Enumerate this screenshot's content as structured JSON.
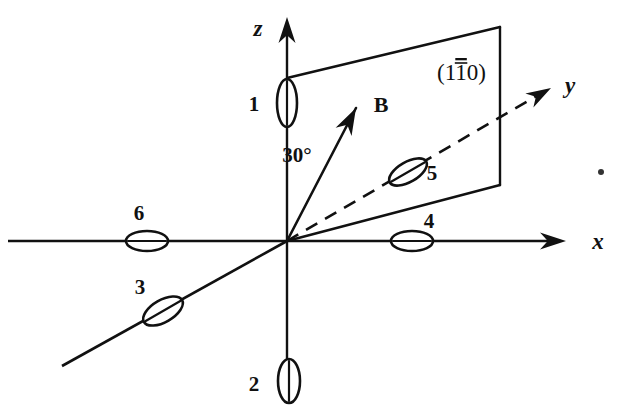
{
  "figure": {
    "background_color": "#ffffff",
    "ink_color": "#111111",
    "width": 631,
    "height": 419
  },
  "axes": {
    "x": {
      "label": "x",
      "label_x": 598,
      "label_y": 249,
      "line": {
        "x1": 8,
        "y1": 241,
        "x2": 556,
        "y2": 241
      },
      "arrow_at": {
        "x": 566,
        "y": 241
      },
      "style": "solid"
    },
    "y": {
      "label": "y",
      "label_x": 570,
      "label_y": 93,
      "line": {
        "x1": 287,
        "y1": 241,
        "x2": 540,
        "y2": 94
      },
      "arrow_at": {
        "x": 551,
        "y": 88
      },
      "style": "dashed",
      "negative_extension": {
        "x1": 287,
        "y1": 241,
        "x2": 62,
        "y2": 366,
        "style": "solid"
      }
    },
    "z": {
      "label": "z",
      "label_x": 258,
      "label_y": 36,
      "line": {
        "x1": 287,
        "y1": 398,
        "x2": 287,
        "y2": 29
      },
      "arrow_at": {
        "x": 287,
        "y": 17
      },
      "style": "solid"
    }
  },
  "origin": {
    "x": 287,
    "y": 241
  },
  "field_vector": {
    "symbol": "B",
    "label_x": 381,
    "label_y": 112,
    "angle_from_z_deg": "30°",
    "angle_label_x": 297,
    "angle_label_y": 162,
    "tail": {
      "x": 287,
      "y": 241
    },
    "tip": {
      "x": 356,
      "y": 108
    }
  },
  "plane": {
    "label": "(110)",
    "label_parts": {
      "pre": "(1",
      "barred": "1",
      "post": "0)"
    },
    "label_x": 437,
    "label_y": 80,
    "vertices": [
      {
        "x": 287,
        "y": 78
      },
      {
        "x": 500,
        "y": 27
      },
      {
        "x": 500,
        "y": 185
      },
      {
        "x": 287,
        "y": 241
      }
    ],
    "drawn_edges": [
      "top",
      "right",
      "bottom-slant"
    ]
  },
  "domains": [
    {
      "id": "1",
      "label": "1",
      "label_x": 254,
      "label_y": 111,
      "center_x": 287,
      "center_y": 103,
      "rx": 10,
      "ry": 24,
      "rotation_deg": 0,
      "orientation": "vertical",
      "on_axis": "z-positive"
    },
    {
      "id": "2",
      "label": "2",
      "label_x": 254,
      "label_y": 391,
      "center_x": 289,
      "center_y": 381,
      "rx": 11,
      "ry": 22,
      "rotation_deg": 0,
      "orientation": "vertical",
      "on_axis": "z-negative"
    },
    {
      "id": "3",
      "label": "3",
      "label_x": 140,
      "label_y": 294,
      "center_x": 163,
      "center_y": 311,
      "rx": 22,
      "ry": 11,
      "rotation_deg": -30,
      "orientation": "tilted",
      "on_axis": "y-negative"
    },
    {
      "id": "4",
      "label": "4",
      "label_x": 429,
      "label_y": 228,
      "center_x": 412,
      "center_y": 241,
      "rx": 21,
      "ry": 10,
      "rotation_deg": 0,
      "orientation": "horizontal",
      "on_axis": "x-positive"
    },
    {
      "id": "5",
      "label": "5",
      "label_x": 432,
      "label_y": 180,
      "center_x": 408,
      "center_y": 172,
      "rx": 21,
      "ry": 10,
      "rotation_deg": -30,
      "orientation": "tilted",
      "on_axis": "y-positive"
    },
    {
      "id": "6",
      "label": "6",
      "label_x": 139,
      "label_y": 220,
      "center_x": 147,
      "center_y": 241,
      "rx": 21,
      "ry": 10,
      "rotation_deg": 0,
      "orientation": "horizontal",
      "on_axis": "x-negative"
    }
  ],
  "stray_mark": {
    "x": 601,
    "y": 172,
    "r": 3
  }
}
